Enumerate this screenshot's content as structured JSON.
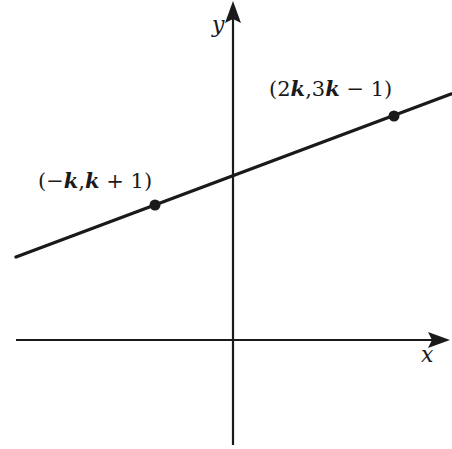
{
  "diagram": {
    "type": "coordinate-plane-line",
    "axes": {
      "x_label": "x",
      "y_label": "y",
      "color": "#1a1a1a"
    },
    "line": {
      "description": "straight line with positive slope crossing the positive y-axis",
      "color": "#1a1a1a"
    },
    "points": [
      {
        "name": "left-point",
        "label": "(−k,k + 1)",
        "parts": [
          "(−",
          "k",
          ",",
          "k",
          " + 1)"
        ]
      },
      {
        "name": "right-point",
        "label": "(2k,3k − 1)",
        "parts": [
          "(2",
          "k",
          ",3",
          "k",
          " − 1)"
        ]
      }
    ]
  }
}
